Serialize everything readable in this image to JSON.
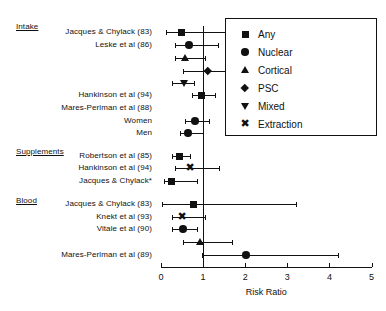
{
  "chart_data": {
    "type": "scatter",
    "subtype": "forest-plot",
    "title": "",
    "xlabel": "Risk Ratio",
    "ylabel": "",
    "xlim": [
      0,
      5
    ],
    "xticks": [
      0,
      1,
      2,
      3,
      4,
      5
    ],
    "xticklabels": [
      "0",
      "1",
      "2",
      "3",
      "4",
      "5"
    ],
    "grid": false,
    "reference_line": 1,
    "legend_position": "top-right",
    "legend": [
      {
        "label": "Any",
        "marker": "square"
      },
      {
        "label": "Nuclear",
        "marker": "circle"
      },
      {
        "label": "Cortical",
        "marker": "triangle-up"
      },
      {
        "label": "PSC",
        "marker": "diamond"
      },
      {
        "label": "Mixed",
        "marker": "triangle-down"
      },
      {
        "label": "Extraction",
        "marker": "x"
      }
    ],
    "sections": [
      {
        "label": "Intake",
        "y": 22
      },
      {
        "label": "Supplements",
        "y": 147
      },
      {
        "label": "Blood",
        "y": 196
      }
    ],
    "rows": [
      {
        "label": "Jacques & Chylack (83)",
        "marker": "square",
        "rr": 0.48,
        "lo": 0.12,
        "hi": 1.83,
        "y": 32,
        "labeled": true
      },
      {
        "label": "Leske et al (86)",
        "marker": "circle",
        "rr": 0.67,
        "lo": 0.34,
        "hi": 1.36,
        "y": 45,
        "labeled": true
      },
      {
        "label": "",
        "marker": "triangle-up",
        "rr": 0.57,
        "lo": 0.33,
        "hi": 1.05,
        "y": 58,
        "labeled": false
      },
      {
        "label": "",
        "marker": "diamond",
        "rr": 1.12,
        "lo": 0.52,
        "hi": 2.68,
        "y": 71,
        "labeled": false
      },
      {
        "label": "",
        "marker": "triangle-down",
        "rr": 0.55,
        "lo": 0.26,
        "hi": 0.79,
        "y": 83,
        "labeled": false
      },
      {
        "label": "Hankinson et al (94)",
        "marker": "square",
        "rr": 0.97,
        "lo": 0.74,
        "hi": 1.28,
        "y": 95,
        "labeled": true
      },
      {
        "label": "Mares-Perlman et al (88)",
        "marker": "none",
        "rr": null,
        "lo": null,
        "hi": null,
        "y": 108,
        "labeled": true
      },
      {
        "label": "Women",
        "marker": "circle",
        "rr": 0.81,
        "lo": 0.57,
        "hi": 1.14,
        "y": 121,
        "labeled": true
      },
      {
        "label": "Men",
        "marker": "circle",
        "rr": 0.64,
        "lo": 0.45,
        "hi": 0.99,
        "y": 133,
        "labeled": true
      },
      {
        "label": "Robertson et al (85)",
        "marker": "square",
        "rr": 0.45,
        "lo": 0.26,
        "hi": 0.69,
        "y": 156,
        "labeled": true
      },
      {
        "label": "Hankinson et al (94)",
        "marker": "x",
        "rr": 0.69,
        "lo": 0.33,
        "hi": 1.38,
        "y": 168,
        "labeled": true
      },
      {
        "label": "Jacques & Chylack*",
        "marker": "square",
        "rr": 0.26,
        "lo": 0.07,
        "hi": 0.85,
        "y": 181,
        "labeled": true
      },
      {
        "label": "Jacques & Chylack (83)",
        "marker": "square",
        "rr": 0.78,
        "lo": 0.02,
        "hi": 3.2,
        "y": 204,
        "labeled": true
      },
      {
        "label": "Knekt et al (93)",
        "marker": "x",
        "rr": 0.5,
        "lo": 0.26,
        "hi": 1.05,
        "y": 217,
        "labeled": true
      },
      {
        "label": "Vitale et al (90)",
        "marker": "circle",
        "rr": 0.52,
        "lo": 0.26,
        "hi": 0.85,
        "y": 229,
        "labeled": true
      },
      {
        "label": "",
        "marker": "triangle-up",
        "rr": 0.92,
        "lo": 0.52,
        "hi": 1.68,
        "y": 242,
        "labeled": false
      },
      {
        "label": "Mares-Perlman et al (89)",
        "marker": "circle",
        "rr": 2.02,
        "lo": 0.98,
        "hi": 4.2,
        "y": 255,
        "labeled": true
      }
    ]
  }
}
